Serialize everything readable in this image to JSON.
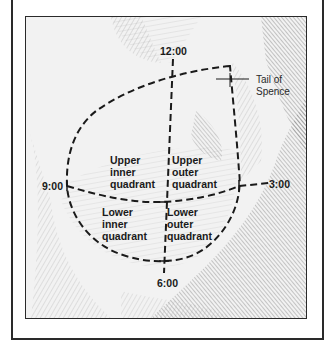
{
  "diagram": {
    "clock_positions": {
      "top": "12:00",
      "left": "9:00",
      "right": "3:00",
      "bottom": "6:00"
    },
    "quadrants": {
      "upper_inner": [
        "Upper",
        "inner",
        "quadrant"
      ],
      "upper_outer": [
        "Upper",
        "outer",
        "quadrant"
      ],
      "lower_inner": [
        "Lower",
        "inner",
        "quadrant"
      ],
      "lower_outer": [
        "Lower",
        "outer",
        "quadrant"
      ]
    },
    "tail_label": [
      "Tail of",
      "Spence"
    ],
    "colors": {
      "line": "#1a1a1a",
      "frame": "#2a2a2a",
      "background": "#ffffff",
      "sketch_light": "#d8d8d8",
      "sketch_dark": "#6a6a6a"
    }
  }
}
